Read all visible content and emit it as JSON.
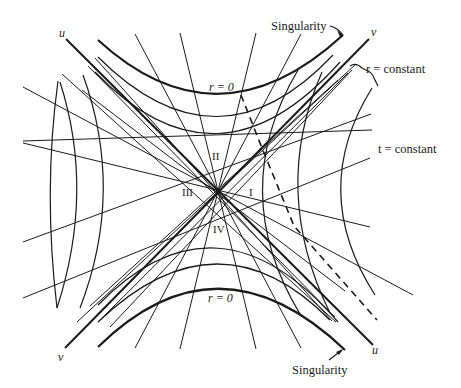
{
  "diagram": {
    "type": "Kruskal-Szekeres spacetime diagram",
    "center": [
      218,
      191
    ],
    "colors": {
      "ink": "#1a1a1a",
      "background": "#ffffff"
    },
    "axes": {
      "u_top": "u",
      "v_top": "v",
      "v_bottom": "v",
      "u_bottom": "u"
    },
    "regions": {
      "I": "I",
      "II": "II",
      "III": "III",
      "IV": "IV"
    },
    "labels": {
      "singularity_top": "Singularity",
      "singularity_bottom": "Singularity",
      "r_zero_top": "r = 0",
      "r_zero_bottom": "r = 0",
      "r_constant": "r = constant",
      "t_constant": "t = constant"
    }
  }
}
